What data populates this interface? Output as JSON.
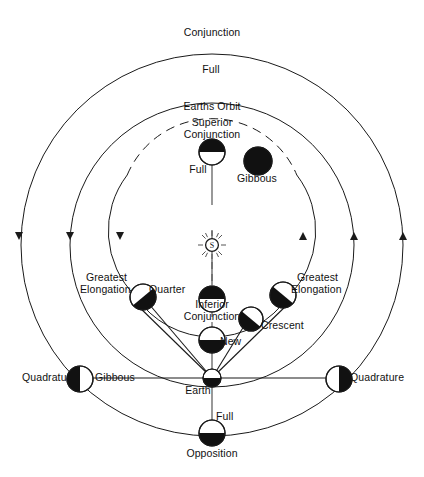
{
  "diagram": {
    "sun": {
      "symbol": "S",
      "name": "Sun",
      "cx": 212,
      "cy": 245
    },
    "earth": {
      "label": "Earth",
      "cx": 212,
      "cy": 378
    },
    "orbits": [
      {
        "name": "superior-planet-orbit",
        "radius": 191,
        "style": "solid"
      },
      {
        "name": "earths-orbit",
        "radius": 142,
        "style": "solid",
        "label": "Earths Orbit"
      },
      {
        "name": "inferior-planet-orbit",
        "radius": 92,
        "style": "partial-dashed"
      }
    ],
    "labels": {
      "conjunction": "Conjunction",
      "full_top": "Full",
      "earths_orbit": "Earths Orbit",
      "superior_conjunction_line1": "Superior",
      "superior_conjunction_line2": "Conjunction",
      "full_superior": "Full",
      "gibbous_upper_right": "Gibbous",
      "greatest_elongation_left_line1": "Greatest",
      "greatest_elongation_left_line2": "Elongation",
      "quarter": "Quarter",
      "greatest_elongation_right_line1": "Greatest",
      "greatest_elongation_right_line2": "Elongation",
      "inferior_conjunction_line1": "Inferior",
      "inferior_conjunction_line2": "Conjunction",
      "new": "New",
      "crescent": "Crescent",
      "quadrature_left": "Quadrature",
      "gibbous_lower_left": "Gibbous",
      "quadrature_right": "Quadrature",
      "earth": "Earth",
      "full_opposition": "Full",
      "opposition": "Opposition"
    },
    "phase_bodies": [
      {
        "name": "conjunction-body",
        "cx": 212,
        "cy": 152,
        "r": 13,
        "dark": "top",
        "phase": "Full",
        "config": "Conjunction"
      },
      {
        "name": "superior-conjunction-body",
        "cx": 212,
        "cy": 299,
        "r": 13,
        "dark": "top",
        "phase": "Full",
        "config": "Superior Conjunction"
      },
      {
        "name": "gibbous-upper-right-body",
        "cx": 258,
        "cy": 161,
        "r": 14,
        "dark": "upper-right",
        "phase": "Gibbous"
      },
      {
        "name": "quarter-left-body",
        "cx": 143,
        "cy": 297,
        "r": 13,
        "dark": "lower-left",
        "phase": "Quarter",
        "config": "Greatest Elongation"
      },
      {
        "name": "greatest-elongation-right-body",
        "cx": 283,
        "cy": 295,
        "r": 13,
        "dark": "lower-right",
        "config": "Greatest Elongation"
      },
      {
        "name": "crescent-body",
        "cx": 251,
        "cy": 319,
        "r": 12,
        "dark": "lower-left",
        "phase": "Crescent"
      },
      {
        "name": "inferior-conjunction-body",
        "cx": 212,
        "cy": 340,
        "r": 13,
        "dark": "bottom",
        "phase": "New",
        "config": "Inferior Conjunction"
      },
      {
        "name": "quadrature-left-body",
        "cx": 80,
        "cy": 379,
        "r": 13,
        "dark": "left",
        "phase": "Gibbous",
        "config": "Quadrature"
      },
      {
        "name": "quadrature-right-body",
        "cx": 339,
        "cy": 379,
        "r": 13,
        "dark": "right",
        "config": "Quadrature"
      },
      {
        "name": "opposition-body",
        "cx": 212,
        "cy": 433,
        "r": 13,
        "dark": "bottom",
        "phase": "Full",
        "config": "Opposition"
      },
      {
        "name": "earth-body",
        "cx": 212,
        "cy": 378,
        "r": 9,
        "dark": "bottom",
        "config": "Earth"
      }
    ],
    "colors": {
      "ink": "#111111",
      "line": "#1a1a1a",
      "background": "#ffffff"
    },
    "orbit_direction": "left side arrows point down, right side arrows point up"
  }
}
